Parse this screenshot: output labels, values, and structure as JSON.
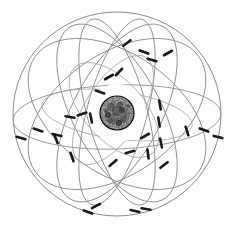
{
  "figure": {
    "background_color": "#ffffff",
    "width": 232,
    "height": 229
  },
  "nucleus": {
    "label": "nucleus",
    "center_x": 117,
    "center_y": 113,
    "radius": 17,
    "color": "#111111",
    "highlight_color": "#4a4a4a"
  },
  "colors": {
    "orbit_stroke": "#8a8a8a",
    "orbit_faint_stroke": "#a8a8a8",
    "orbit_outer_stroke": "#7e7e7e",
    "electron_fill": "#1a1a1a",
    "background": "#ffffff"
  },
  "orbits": [
    {
      "name": "outer-boundary-circle",
      "cx": 117,
      "cy": 114,
      "rx": 104,
      "ry": 102,
      "rotation": 0,
      "style": "outer"
    },
    {
      "name": "equatorial-ellipse",
      "cx": 117,
      "cy": 117,
      "rx": 104,
      "ry": 32,
      "rotation": -2,
      "style": "orbit"
    },
    {
      "name": "orbit-tilt-right-large",
      "cx": 117,
      "cy": 113,
      "rx": 98,
      "ry": 44,
      "rotation": 62,
      "style": "orbit"
    },
    {
      "name": "orbit-tilt-left-large",
      "cx": 117,
      "cy": 113,
      "rx": 98,
      "ry": 44,
      "rotation": -62,
      "style": "orbit"
    },
    {
      "name": "orbit-tilt-right-steep",
      "cx": 117,
      "cy": 112,
      "rx": 96,
      "ry": 30,
      "rotation": 75,
      "style": "orbit"
    },
    {
      "name": "orbit-tilt-left-steep",
      "cx": 117,
      "cy": 112,
      "rx": 96,
      "ry": 30,
      "rotation": -75,
      "style": "orbit"
    },
    {
      "name": "orbit-diagonal-wide-right",
      "cx": 117,
      "cy": 114,
      "rx": 100,
      "ry": 60,
      "rotation": 35,
      "style": "orbit"
    },
    {
      "name": "orbit-diagonal-wide-left",
      "cx": 117,
      "cy": 114,
      "rx": 100,
      "ry": 60,
      "rotation": -35,
      "style": "orbit"
    },
    {
      "name": "orbit-inner-tilted",
      "cx": 113,
      "cy": 110,
      "rx": 62,
      "ry": 28,
      "rotation": -58,
      "style": "faint"
    },
    {
      "name": "orbit-inner-oval",
      "cx": 114,
      "cy": 110,
      "rx": 58,
      "ry": 30,
      "rotation": 48,
      "style": "faint"
    },
    {
      "name": "orbit-mid-flat",
      "cx": 117,
      "cy": 115,
      "rx": 76,
      "ry": 24,
      "rotation": 8,
      "style": "faint"
    }
  ],
  "electrons": [
    {
      "name": "electron-1",
      "x": 127,
      "y": 43,
      "angle": -38
    },
    {
      "name": "electron-2",
      "x": 144,
      "y": 52,
      "angle": 20
    },
    {
      "name": "electron-3",
      "x": 168,
      "y": 53,
      "angle": -30
    },
    {
      "name": "electron-4",
      "x": 152,
      "y": 60,
      "angle": 15
    },
    {
      "name": "electron-5",
      "x": 109,
      "y": 77,
      "angle": -30
    },
    {
      "name": "electron-6",
      "x": 119,
      "y": 72,
      "angle": -46
    },
    {
      "name": "electron-7",
      "x": 160,
      "y": 105,
      "angle": 80
    },
    {
      "name": "electron-8",
      "x": 159,
      "y": 122,
      "angle": 80
    },
    {
      "name": "electron-9",
      "x": 70,
      "y": 117,
      "angle": 10
    },
    {
      "name": "electron-10",
      "x": 82,
      "y": 114,
      "angle": -18
    },
    {
      "name": "electron-11",
      "x": 38,
      "y": 130,
      "angle": 18
    },
    {
      "name": "electron-12",
      "x": 57,
      "y": 135,
      "angle": 14
    },
    {
      "name": "electron-13",
      "x": 21,
      "y": 138,
      "angle": 16
    },
    {
      "name": "electron-14",
      "x": 187,
      "y": 131,
      "angle": 72
    },
    {
      "name": "electron-15",
      "x": 204,
      "y": 130,
      "angle": 20
    },
    {
      "name": "electron-16",
      "x": 218,
      "y": 137,
      "angle": 14
    },
    {
      "name": "electron-17",
      "x": 145,
      "y": 136,
      "angle": -30
    },
    {
      "name": "electron-18",
      "x": 161,
      "y": 143,
      "angle": 78
    },
    {
      "name": "electron-19",
      "x": 130,
      "y": 152,
      "angle": -16
    },
    {
      "name": "electron-20",
      "x": 148,
      "y": 154,
      "angle": 82
    },
    {
      "name": "electron-21",
      "x": 56,
      "y": 139,
      "angle": 68
    },
    {
      "name": "electron-22",
      "x": 113,
      "y": 163,
      "angle": -40
    },
    {
      "name": "electron-23",
      "x": 164,
      "y": 165,
      "angle": -38
    },
    {
      "name": "electron-24",
      "x": 96,
      "y": 206,
      "angle": -28
    },
    {
      "name": "electron-25",
      "x": 88,
      "y": 212,
      "angle": 20
    },
    {
      "name": "electron-26",
      "x": 135,
      "y": 211,
      "angle": 12
    },
    {
      "name": "electron-27",
      "x": 146,
      "y": 209,
      "angle": 10
    },
    {
      "name": "electron-28",
      "x": 100,
      "y": 92,
      "angle": 18
    },
    {
      "name": "electron-29",
      "x": 91,
      "y": 118,
      "angle": 78
    },
    {
      "name": "electron-30",
      "x": 72,
      "y": 157,
      "angle": 70
    }
  ]
}
